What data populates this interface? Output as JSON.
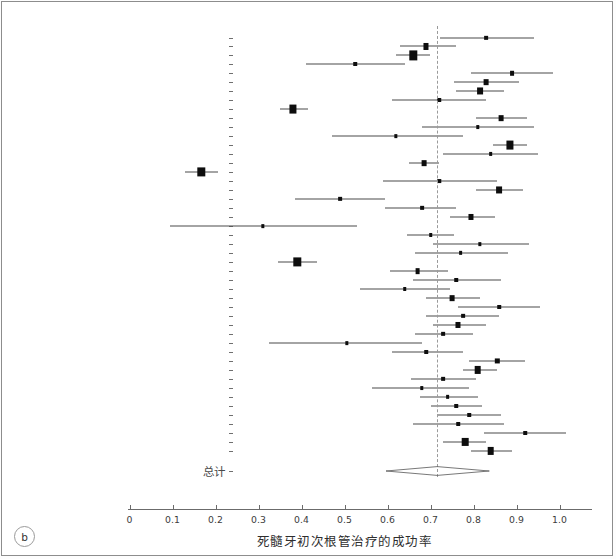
{
  "panel": {
    "badge": "b"
  },
  "axis": {
    "title": "死髓牙初次根管治疗的成功率",
    "ticks": [
      "0",
      "0.1",
      "0.2",
      "0.3",
      "0.4",
      "0.5",
      "0.6",
      "0.7",
      "0.8",
      "0.9",
      "1.0"
    ],
    "tick_values": [
      0,
      0.1,
      0.2,
      0.3,
      0.4,
      0.5,
      0.6,
      0.7,
      0.8,
      0.9,
      1.0
    ],
    "xmin": 0.0,
    "xmax": 1.07,
    "reference_value": 0.716
  },
  "summary": {
    "label": "总计",
    "estimate": 0.716,
    "lower": 0.662,
    "upper": 0.772
  },
  "colors": {
    "point": "#0d0d0d",
    "ci": "#4a4a4a",
    "reference": "#9a9a9a",
    "frame": "#8d8d8d",
    "text": "#3b3b3b"
  },
  "chart_data": {
    "type": "forest",
    "title": "",
    "xlabel": "死髓牙初次根管治疗的成功率",
    "ylabel": "",
    "xlim": [
      0.0,
      1.07
    ],
    "grid": false,
    "legend": "none",
    "reference_line": 0.716,
    "summary": {
      "label": "总计",
      "estimate": 0.716,
      "lower": 0.662,
      "upper": 0.772
    },
    "studies": [
      {
        "label": "Auerbach (1938)",
        "estimate": 0.83,
        "lower": 0.723,
        "upper": 0.94,
        "weight": 0.3
      },
      {
        "label": "Buchbinder (1941)",
        "estimate": 0.69,
        "lower": 0.63,
        "upper": 0.76,
        "weight": 0.55
      },
      {
        "label": "Castagnola & Orlay (1952)",
        "estimate": 0.66,
        "lower": 0.62,
        "upper": 0.7,
        "weight": 1.0
      },
      {
        "label": "Heling & Tamshe (1970)",
        "estimate": 0.525,
        "lower": 0.41,
        "upper": 0.64,
        "weight": 0.26
      },
      {
        "label": "Cvek (1972)",
        "estimate": 0.89,
        "lower": 0.795,
        "upper": 0.985,
        "weight": 0.32
      },
      {
        "label": "Werts (1975)",
        "estimate": 0.83,
        "lower": 0.755,
        "upper": 0.905,
        "weight": 0.5
      },
      {
        "label": "Adenubi & Rule (1976)",
        "estimate": 0.815,
        "lower": 0.76,
        "upper": 0.87,
        "weight": 0.7
      },
      {
        "label": "Heling & Shapira (1978)",
        "estimate": 0.72,
        "lower": 0.61,
        "upper": 0.83,
        "weight": 0.26
      },
      {
        "label": "Jokinen et al. (1978)",
        "estimate": 0.38,
        "lower": 0.35,
        "upper": 0.415,
        "weight": 0.95
      },
      {
        "label": "Barbakow et al. (1980)",
        "estimate": 0.865,
        "lower": 0.805,
        "upper": 0.925,
        "weight": 0.5
      },
      {
        "label": "Cvek et al. (1982)",
        "estimate": 0.81,
        "lower": 0.68,
        "upper": 0.94,
        "weight": 0.24
      },
      {
        "label": "Boggia (1983)",
        "estimate": 0.62,
        "lower": 0.47,
        "upper": 0.775,
        "weight": 0.22
      },
      {
        "label": "Pekruhn (1986)",
        "estimate": 0.885,
        "lower": 0.845,
        "upper": 0.925,
        "weight": 0.95
      },
      {
        "label": "Bystrom et al. (1987)",
        "estimate": 0.84,
        "lower": 0.73,
        "upper": 0.95,
        "weight": 0.28
      },
      {
        "label": "Halse & Molven (1987)",
        "estimate": 0.685,
        "lower": 0.65,
        "upper": 0.72,
        "weight": 0.5
      },
      {
        "label": "Safavi et al. (1987)",
        "estimate": 0.167,
        "lower": 0.13,
        "upper": 0.205,
        "weight": 1.0
      },
      {
        "label": "Akerblom & Hasselgren (1988)",
        "estimate": 0.72,
        "lower": 0.59,
        "upper": 0.855,
        "weight": 0.24
      },
      {
        "label": "Sjogren et al. (1990)",
        "estimate": 0.86,
        "lower": 0.805,
        "upper": 0.915,
        "weight": 0.7
      },
      {
        "label": "Murphy et al. (1991)",
        "estimate": 0.49,
        "lower": 0.385,
        "upper": 0.595,
        "weight": 0.3
      },
      {
        "label": "Friedman et al. (1995)",
        "estimate": 0.68,
        "lower": 0.595,
        "upper": 0.76,
        "weight": 0.3
      },
      {
        "label": "Calisken & Sen (1996)",
        "estimate": 0.795,
        "lower": 0.745,
        "upper": 0.85,
        "weight": 0.55
      },
      {
        "label": "Peretz et al. (1997)",
        "estimate": 0.31,
        "lower": 0.095,
        "upper": 0.53,
        "weight": 0.22
      },
      {
        "label": "Sjogren et al. (1997)",
        "estimate": 0.7,
        "lower": 0.645,
        "upper": 0.755,
        "weight": 0.26
      },
      {
        "label": "Lilly et al. (1998)",
        "estimate": 0.815,
        "lower": 0.705,
        "upper": 0.93,
        "weight": 0.22
      },
      {
        "label": "Weiger et al. (2000)",
        "estimate": 0.77,
        "lower": 0.665,
        "upper": 0.88,
        "weight": 0.3
      },
      {
        "label": "Cheung (2001)",
        "estimate": 0.39,
        "lower": 0.345,
        "upper": 0.435,
        "weight": 1.0
      },
      {
        "label": "Hoskinson et al. (2002)",
        "estimate": 0.67,
        "lower": 0.605,
        "upper": 0.74,
        "weight": 0.5
      },
      {
        "label": "Peters & Wesselink (2002)",
        "estimate": 0.76,
        "lower": 0.66,
        "upper": 0.865,
        "weight": 0.26
      },
      {
        "label": "Chugal et al. (2003)",
        "estimate": 0.64,
        "lower": 0.535,
        "upper": 0.745,
        "weight": 0.26
      },
      {
        "label": "Huumonen et al. (2003)",
        "estimate": 0.75,
        "lower": 0.69,
        "upper": 0.815,
        "weight": 0.5
      },
      {
        "label": "Khedmat (2004)",
        "estimate": 0.86,
        "lower": 0.765,
        "upper": 0.955,
        "weight": 0.26
      },
      {
        "label": "Chu et al. (2005)",
        "estimate": 0.775,
        "lower": 0.69,
        "upper": 0.86,
        "weight": 0.3
      },
      {
        "label": "Agrabawi (2006)",
        "estimate": 0.765,
        "lower": 0.705,
        "upper": 0.83,
        "weight": 0.55
      },
      {
        "label": "Doyle et al. (2006)",
        "estimate": 0.73,
        "lower": 0.665,
        "upper": 0.8,
        "weight": 0.3
      },
      {
        "label": "Conner et al. (2007)",
        "estimate": 0.505,
        "lower": 0.325,
        "upper": 0.68,
        "weight": 0.22
      },
      {
        "label": "Molander et al. (2007)",
        "estimate": 0.69,
        "lower": 0.61,
        "upper": 0.775,
        "weight": 0.26
      },
      {
        "label": "Sari & Duruturk (2007)",
        "estimate": 0.855,
        "lower": 0.79,
        "upper": 0.92,
        "weight": 0.42
      },
      {
        "label": "Chevigny et al. (2008)",
        "estimate": 0.81,
        "lower": 0.775,
        "upper": 0.855,
        "weight": 0.85
      },
      {
        "label": "Cotton et al. (2008)",
        "estimate": 0.73,
        "lower": 0.655,
        "upper": 0.805,
        "weight": 0.3
      },
      {
        "label": "Penesis et al. (2008)",
        "estimate": 0.68,
        "lower": 0.565,
        "upper": 0.79,
        "weight": 0.24
      },
      {
        "label": "Siqueira et al. (2008)",
        "estimate": 0.74,
        "lower": 0.675,
        "upper": 0.81,
        "weight": 0.3
      },
      {
        "label": "Hsiao et al. (2009)",
        "estimate": 0.76,
        "lower": 0.7,
        "upper": 0.82,
        "weight": 0.26
      },
      {
        "label": "Mente et al. (2009)",
        "estimate": 0.79,
        "lower": 0.715,
        "upper": 0.865,
        "weight": 0.26
      },
      {
        "label": "Tervit et al. (2009)",
        "estimate": 0.765,
        "lower": 0.66,
        "upper": 0.87,
        "weight": 0.26
      },
      {
        "label": "Ng et al. (2011)",
        "estimate": 0.92,
        "lower": 0.825,
        "upper": 1.015,
        "weight": 0.26
      },
      {
        "label": "Ricucci et al. (2011)",
        "estimate": 0.78,
        "lower": 0.73,
        "upper": 0.83,
        "weight": 0.85
      },
      {
        "label": "Liang et al. (2012)",
        "estimate": 0.84,
        "lower": 0.795,
        "upper": 0.89,
        "weight": 0.85
      }
    ]
  }
}
